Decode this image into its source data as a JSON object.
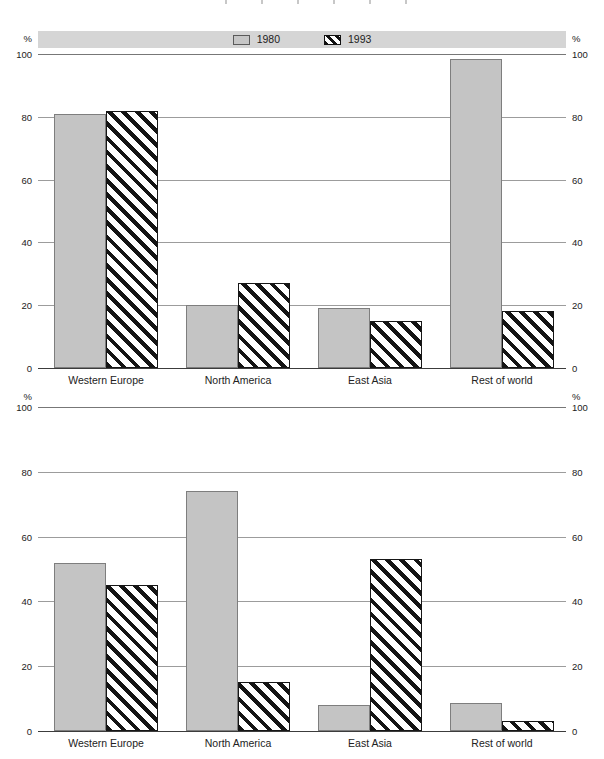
{
  "figure": {
    "cropped_top_text": "",
    "note_colors": {
      "legend_band": "#d5d5d5",
      "bar_fill_1980": "#c4c4c4",
      "bar_border_1980": "#7e7e7e",
      "hatch_foreground_1993": "#141414",
      "hatch_background_1993": "#ffffff",
      "gridline": "#9c9c9c",
      "baseline": "#3c3c3c",
      "text": "#222222"
    }
  },
  "legend": {
    "items": [
      {
        "label": "1980",
        "swatch": "solid-gray-square"
      },
      {
        "label": "1993",
        "swatch": "diagonal-hatch-square"
      }
    ]
  },
  "chart_data": [
    {
      "type": "bar",
      "title": "",
      "categories": [
        "Western Europe",
        "North America",
        "East Asia",
        "Rest of world"
      ],
      "series": [
        {
          "name": "1980",
          "style": "solid",
          "values": [
            81,
            20,
            19,
            98.5
          ]
        },
        {
          "name": "1993",
          "style": "hatch",
          "values": [
            82,
            27,
            15,
            18
          ]
        }
      ],
      "xlabel": "",
      "ylabel": "%",
      "yticks": [
        0,
        20,
        40,
        60,
        80,
        100
      ],
      "ylim": [
        0,
        100
      ],
      "grid": true,
      "axis_label_sides": "left and right",
      "legend_position": "top band above chart"
    },
    {
      "type": "bar",
      "title": "",
      "categories": [
        "Western Europe",
        "North America",
        "East Asia",
        "Rest of world"
      ],
      "series": [
        {
          "name": "1980",
          "style": "solid",
          "values": [
            52,
            74,
            8,
            8.5
          ]
        },
        {
          "name": "1993",
          "style": "hatch",
          "values": [
            45,
            15,
            53,
            3
          ]
        }
      ],
      "xlabel": "",
      "ylabel": "%",
      "yticks": [
        0,
        20,
        40,
        60,
        80,
        100
      ],
      "ylim": [
        0,
        100
      ],
      "grid": true,
      "axis_label_sides": "left and right",
      "legend_position": "shared with upper chart"
    }
  ]
}
